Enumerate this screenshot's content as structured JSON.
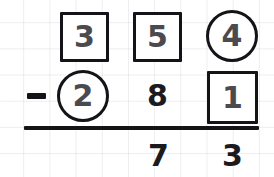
{
  "worksheet": {
    "type": "vertical-subtraction",
    "operator_symbol": "−",
    "background": "graph-paper",
    "ink_color": "#141418",
    "marked_digit_color": "#4a4a4f",
    "minuend": "354",
    "subtrahend": "281",
    "difference": "73",
    "rows": [
      {
        "role": "minuend",
        "cells": [
          {
            "value": "3",
            "marker": "box",
            "place": "hundreds"
          },
          {
            "value": "5",
            "marker": "box",
            "place": "tens"
          },
          {
            "value": "4",
            "marker": "circle",
            "place": "ones"
          }
        ]
      },
      {
        "role": "subtrahend",
        "operator": "−",
        "cells": [
          {
            "value": "2",
            "marker": "circle",
            "place": "hundreds"
          },
          {
            "value": "8",
            "marker": "none",
            "place": "tens"
          },
          {
            "value": "1",
            "marker": "box",
            "place": "ones"
          }
        ]
      },
      {
        "role": "difference",
        "cells": [
          {
            "value": "",
            "marker": "none",
            "place": "hundreds"
          },
          {
            "value": "7",
            "marker": "none",
            "place": "tens"
          },
          {
            "value": "3",
            "marker": "none",
            "place": "ones"
          }
        ]
      }
    ]
  }
}
